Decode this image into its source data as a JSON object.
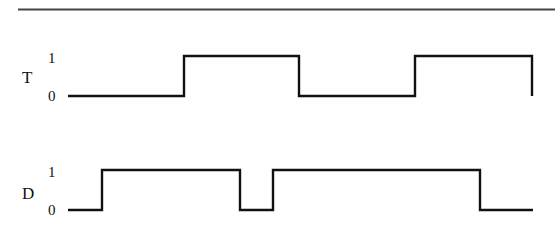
{
  "diagram": {
    "type": "timing-diagram",
    "rule_color": "#444444",
    "wave_color": "#111111",
    "signals": [
      {
        "name": "T",
        "levels": {
          "high": "1",
          "low": "0"
        },
        "waveform": [
          {
            "x": 68,
            "level": 0
          },
          {
            "x": 184,
            "level": 1
          },
          {
            "x": 299,
            "level": 0
          },
          {
            "x": 415,
            "level": 1
          },
          {
            "x": 532,
            "level": 0,
            "end": true
          }
        ]
      },
      {
        "name": "D",
        "levels": {
          "high": "1",
          "low": "0"
        },
        "waveform": [
          {
            "x": 68,
            "level": 0
          },
          {
            "x": 102,
            "level": 1
          },
          {
            "x": 240,
            "level": 0
          },
          {
            "x": 273,
            "level": 1
          },
          {
            "x": 480,
            "level": 0
          },
          {
            "x": 533,
            "level": 0,
            "end": true
          }
        ]
      }
    ]
  },
  "labels": {
    "t_signal": "T",
    "t_high": "1",
    "t_low": "0",
    "d_signal": "D",
    "d_high": "1",
    "d_low": "0"
  }
}
